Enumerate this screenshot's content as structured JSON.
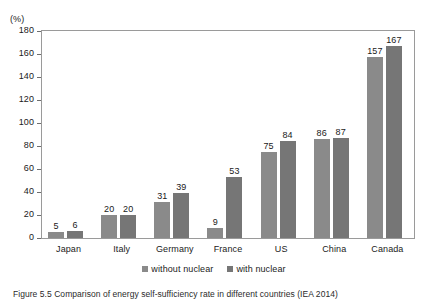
{
  "chart_data": {
    "type": "bar",
    "title": "",
    "xlabel": "",
    "ylabel": "",
    "unit_label": "(%)",
    "categories": [
      "Japan",
      "Italy",
      "Germany",
      "France",
      "US",
      "China",
      "Canada"
    ],
    "series": [
      {
        "name": "without nuclear",
        "values": [
          5,
          20,
          31,
          9,
          75,
          86,
          157
        ],
        "color": "#8a8a8a"
      },
      {
        "name": "with nuclear",
        "values": [
          6,
          20,
          39,
          53,
          84,
          87,
          167
        ],
        "color": "#767676"
      }
    ],
    "ylim": [
      0,
      180
    ],
    "ytick_step": 20,
    "yticks": [
      180,
      160,
      140,
      120,
      100,
      80,
      60,
      40,
      20,
      0
    ],
    "grid": false,
    "legend_position": "bottom-center",
    "show_value_labels": true
  },
  "caption": {
    "text": "Figure 5.5   Comparison of energy self-sufficiency rate in different countries (IEA 2014)"
  }
}
